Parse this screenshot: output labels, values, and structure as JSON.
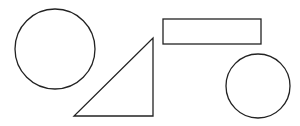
{
  "canvas": {
    "width": 300,
    "height": 126,
    "background": "#ffffff"
  },
  "stroke_color": "#222222",
  "shapes": [
    {
      "type": "circle",
      "name": "large-circle",
      "cx": 55,
      "cy": 49,
      "r": 40
    },
    {
      "type": "triangle",
      "name": "right-triangle",
      "points": [
        [
          74,
          116
        ],
        [
          153,
          116
        ],
        [
          153,
          38
        ]
      ]
    },
    {
      "type": "rectangle",
      "name": "rectangle",
      "x": 163,
      "y": 19,
      "width": 98,
      "height": 25
    },
    {
      "type": "circle",
      "name": "small-circle",
      "cx": 258,
      "cy": 86,
      "r": 32
    }
  ]
}
